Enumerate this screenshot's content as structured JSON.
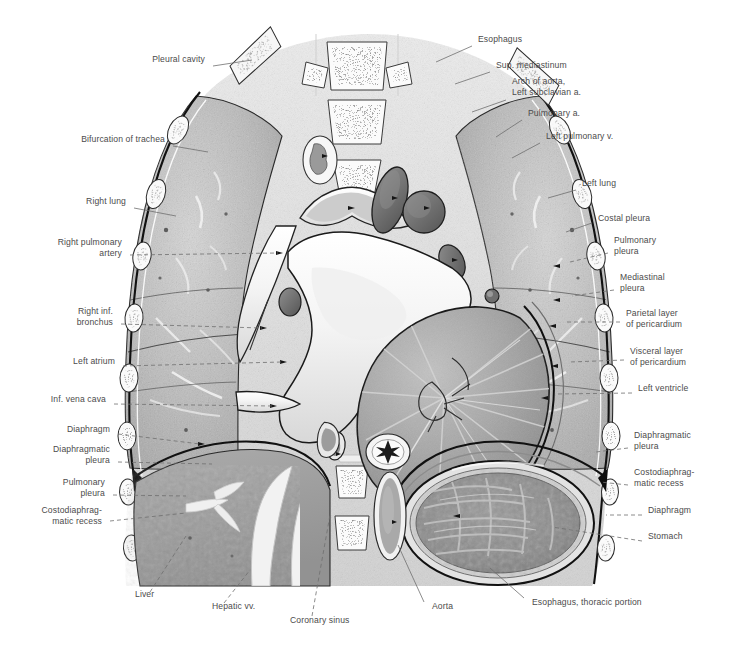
{
  "figure": {
    "style": "grayscale anatomical illustration",
    "colors": {
      "background": "#ffffff",
      "label_text": "#4b4b4b",
      "leader_line": "#6e6e6e",
      "outline": "#1a1a1a",
      "lung_fill": "#b9b9b9",
      "liver_fill": "#9e9e9e",
      "stomach_fill": "#8d8d8d",
      "myocardium_fill": "#a3a3a3",
      "soft_tissue": "#dcdcdc",
      "bone_fill": "#f2f2f2",
      "lumen_fill": "#ffffff"
    }
  },
  "labels_left": [
    {
      "id": "pleural-cavity",
      "text": "Pleural cavity",
      "x": 205,
      "y": 60,
      "lx": 213,
      "ly": 66,
      "tx": 252,
      "ty": 60,
      "dashed": false
    },
    {
      "id": "bifurcation-of-trachea",
      "text": "Bifurcation of trachea",
      "x": 165,
      "y": 140,
      "lx": 173,
      "ly": 146,
      "tx": 208,
      "ty": 152,
      "dashed": false
    },
    {
      "id": "right-lung",
      "text": "Right lung",
      "x": 126,
      "y": 202,
      "lx": 134,
      "ly": 208,
      "tx": 176,
      "ty": 216,
      "dashed": false
    },
    {
      "id": "right-pulmonary-artery",
      "text": "Right pulmonary\nartery",
      "x": 122,
      "y": 243,
      "lx": 130,
      "ly": 255,
      "tx": 278,
      "ty": 253,
      "dashed": true
    },
    {
      "id": "right-inf-bronchus",
      "text": "Right inf.\nbronchus",
      "x": 113,
      "y": 312,
      "lx": 121,
      "ly": 324,
      "tx": 262,
      "ty": 328,
      "dashed": true
    },
    {
      "id": "left-atrium",
      "text": "Left atrium",
      "x": 115,
      "y": 362,
      "lx": 123,
      "ly": 366,
      "tx": 282,
      "ty": 362,
      "dashed": true
    },
    {
      "id": "inf-vena-cava",
      "text": "Inf. vena cava",
      "x": 106,
      "y": 400,
      "lx": 114,
      "ly": 404,
      "tx": 272,
      "ty": 406,
      "dashed": true
    },
    {
      "id": "diaphragm-left",
      "text": "Diaphragm",
      "x": 110,
      "y": 430,
      "lx": 118,
      "ly": 434,
      "tx": 200,
      "ty": 444,
      "dashed": true
    },
    {
      "id": "diaphragmatic-pleura-left",
      "text": "Diaphragmatic\npleura",
      "x": 110,
      "y": 450,
      "lx": 118,
      "ly": 462,
      "tx": 212,
      "ty": 464,
      "dashed": true
    },
    {
      "id": "pulmonary-pleura-left",
      "text": "Pulmonary\npleura",
      "x": 105,
      "y": 483,
      "lx": 113,
      "ly": 495,
      "tx": 186,
      "ty": 496,
      "dashed": true
    },
    {
      "id": "costodiaphragmatic-recess-left",
      "text": "Costodiaphrag-\nmatic recess",
      "x": 102,
      "y": 511,
      "lx": 110,
      "ly": 521,
      "tx": 186,
      "ty": 513,
      "dashed": true
    }
  ],
  "labels_right": [
    {
      "id": "esophagus-top",
      "text": "Esophagus",
      "x": 478,
      "y": 40,
      "lx": 472,
      "ly": 46,
      "tx": 436,
      "ty": 62,
      "dashed": false
    },
    {
      "id": "sup-mediastinum",
      "text": "Sup. mediastinum",
      "x": 496,
      "y": 66,
      "lx": 490,
      "ly": 72,
      "tx": 455,
      "ty": 84,
      "dashed": false
    },
    {
      "id": "arch-of-aorta",
      "text": "Arch of aorta,\nLeft subclavian a.",
      "x": 512,
      "y": 82,
      "lx": 506,
      "ly": 100,
      "tx": 472,
      "ty": 112,
      "dashed": false
    },
    {
      "id": "pulmonary-a",
      "text": "Pulmonary a.",
      "x": 528,
      "y": 114,
      "lx": 522,
      "ly": 120,
      "tx": 496,
      "ty": 137,
      "dashed": false
    },
    {
      "id": "left-pulmonary-v",
      "text": "Left pulmonary v.",
      "x": 546,
      "y": 137,
      "lx": 540,
      "ly": 143,
      "tx": 512,
      "ty": 158,
      "dashed": false
    },
    {
      "id": "left-lung",
      "text": "Left lung",
      "x": 582,
      "y": 184,
      "lx": 576,
      "ly": 190,
      "tx": 548,
      "ty": 198,
      "dashed": false
    },
    {
      "id": "costal-pleura",
      "text": "Costal pleura",
      "x": 598,
      "y": 219,
      "lx": 592,
      "ly": 223,
      "tx": 566,
      "ty": 232,
      "dashed": false
    },
    {
      "id": "pulmonary-pleura-right",
      "text": "Pulmonary\npleura",
      "x": 614,
      "y": 241,
      "lx": 608,
      "ly": 253,
      "tx": 570,
      "ty": 262,
      "dashed": true
    },
    {
      "id": "mediastinal-pleura",
      "text": "Mediastinal\npleura",
      "x": 620,
      "y": 278,
      "lx": 614,
      "ly": 290,
      "tx": 572,
      "ty": 296,
      "dashed": true
    },
    {
      "id": "parietal-layer-pericardium",
      "text": "Parietal layer\nof pericardium",
      "x": 626,
      "y": 314,
      "lx": 620,
      "ly": 322,
      "tx": 566,
      "ty": 322,
      "dashed": true
    },
    {
      "id": "visceral-layer-pericardium",
      "text": "Visceral layer\nof pericardium",
      "x": 630,
      "y": 352,
      "lx": 624,
      "ly": 360,
      "tx": 570,
      "ty": 362,
      "dashed": true
    },
    {
      "id": "left-ventricle",
      "text": "Left ventricle",
      "x": 638,
      "y": 389,
      "lx": 632,
      "ly": 393,
      "tx": 556,
      "ty": 394,
      "dashed": true
    },
    {
      "id": "diaphragmatic-pleura-right",
      "text": "Diaphragmatic\npleura",
      "x": 634,
      "y": 436,
      "lx": 628,
      "ly": 448,
      "tx": 596,
      "ty": 452,
      "dashed": true
    },
    {
      "id": "costodiaphragmatic-recess-right",
      "text": "Costodiaphrag-\nmatic recess",
      "x": 634,
      "y": 473,
      "lx": 628,
      "ly": 485,
      "tx": 600,
      "ty": 482,
      "dashed": true
    },
    {
      "id": "diaphragm-right",
      "text": "Diaphragm",
      "x": 648,
      "y": 511,
      "lx": 642,
      "ly": 515,
      "tx": 606,
      "ty": 515,
      "dashed": true
    },
    {
      "id": "stomach",
      "text": "Stomach",
      "x": 648,
      "y": 537,
      "lx": 642,
      "ly": 541,
      "tx": 552,
      "ty": 527,
      "dashed": true
    }
  ],
  "labels_bottom": [
    {
      "id": "liver",
      "text": "Liver",
      "x": 135,
      "y": 595,
      "lx": 150,
      "ly": 592,
      "tx": 186,
      "ty": 536,
      "dashed": true
    },
    {
      "id": "hepatic-vv",
      "text": "Hepatic vv.",
      "x": 212,
      "y": 607,
      "lx": 224,
      "ly": 603,
      "tx": 250,
      "ty": 570,
      "dashed": true
    },
    {
      "id": "coronary-sinus",
      "text": "Coronary sinus",
      "x": 290,
      "y": 621,
      "lx": 312,
      "ly": 616,
      "tx": 330,
      "ty": 515,
      "dashed": true
    },
    {
      "id": "aorta",
      "text": "Aorta",
      "x": 432,
      "y": 607,
      "lx": 424,
      "ly": 602,
      "tx": 398,
      "ty": 545,
      "dashed": false
    },
    {
      "id": "esophagus-thoracic-portion",
      "text": "Esophagus, thoracic portion",
      "x": 532,
      "y": 603,
      "lx": 524,
      "ly": 598,
      "tx": 490,
      "ty": 568,
      "dashed": false
    }
  ]
}
